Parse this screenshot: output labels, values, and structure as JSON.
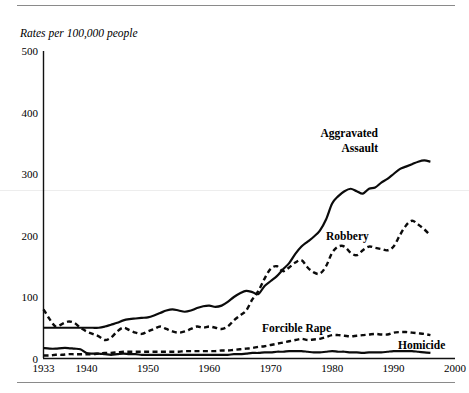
{
  "figure": {
    "axis_title": "Rates per 100,000 people",
    "x_axis_label": "",
    "y_axis_label": ""
  },
  "chart_data": {
    "type": "line",
    "title": "Rates per 100,000 people",
    "xlabel": "",
    "ylabel": "Rates per 100,000 people",
    "xlim": [
      1933,
      2000
    ],
    "ylim": [
      0,
      500
    ],
    "xticks": [
      1933,
      1940,
      1950,
      1960,
      1970,
      1980,
      1990,
      2000
    ],
    "yticks": [
      0,
      100,
      200,
      300,
      400,
      500
    ],
    "grid": false,
    "legend_position": "inline-annotations",
    "annotations": [
      {
        "text": "Aggravated Assault",
        "x": 1982,
        "y": 340,
        "style": "bold",
        "lines": [
          "Aggravated",
          "Assault"
        ]
      },
      {
        "text": "Robbery",
        "x": 1975,
        "y": 200,
        "style": "bold"
      },
      {
        "text": "Forcible Rape",
        "x": 1970,
        "y": 60,
        "style": "bold"
      },
      {
        "text": "Homicide",
        "x": 1988,
        "y": 30,
        "style": "bold"
      }
    ],
    "series": [
      {
        "name": "Aggravated Assault",
        "linestyle": "solid",
        "x": [
          1933,
          1934,
          1935,
          1936,
          1937,
          1938,
          1939,
          1940,
          1941,
          1942,
          1943,
          1944,
          1945,
          1946,
          1947,
          1948,
          1949,
          1950,
          1951,
          1952,
          1953,
          1954,
          1955,
          1956,
          1957,
          1958,
          1959,
          1960,
          1961,
          1962,
          1963,
          1964,
          1965,
          1966,
          1967,
          1968,
          1969,
          1970,
          1971,
          1972,
          1973,
          1974,
          1975,
          1976,
          1977,
          1978,
          1979,
          1980,
          1981,
          1982,
          1983,
          1984,
          1985,
          1986,
          1987,
          1988,
          1989,
          1990,
          1991,
          1992,
          1993,
          1994,
          1995,
          1996
        ],
        "values": [
          50,
          50,
          50,
          50,
          50,
          50,
          50,
          50,
          50,
          50,
          52,
          55,
          58,
          62,
          64,
          65,
          66,
          67,
          70,
          74,
          78,
          80,
          78,
          76,
          78,
          82,
          85,
          86,
          84,
          86,
          92,
          100,
          106,
          110,
          108,
          105,
          118,
          126,
          134,
          145,
          155,
          170,
          182,
          190,
          198,
          208,
          226,
          252,
          264,
          272,
          276,
          272,
          268,
          276,
          278,
          286,
          292,
          300,
          308,
          312,
          316,
          320,
          322,
          320
        ],
        "note": "smoothed reading of the solid upper curve"
      },
      {
        "name": "Robbery",
        "linestyle": "dashed",
        "x": [
          1933,
          1934,
          1935,
          1936,
          1937,
          1938,
          1939,
          1940,
          1941,
          1942,
          1943,
          1944,
          1945,
          1946,
          1947,
          1948,
          1949,
          1950,
          1951,
          1952,
          1953,
          1954,
          1955,
          1956,
          1957,
          1958,
          1959,
          1960,
          1961,
          1962,
          1963,
          1964,
          1965,
          1966,
          1967,
          1968,
          1969,
          1970,
          1971,
          1972,
          1973,
          1974,
          1975,
          1976,
          1977,
          1978,
          1979,
          1980,
          1981,
          1982,
          1983,
          1984,
          1985,
          1986,
          1987,
          1988,
          1989,
          1990,
          1991,
          1992,
          1993,
          1994,
          1995,
          1996
        ],
        "values": [
          80,
          64,
          52,
          56,
          60,
          58,
          50,
          44,
          40,
          36,
          30,
          34,
          44,
          50,
          46,
          42,
          40,
          44,
          48,
          52,
          48,
          44,
          42,
          44,
          48,
          52,
          50,
          52,
          50,
          48,
          52,
          62,
          70,
          78,
          96,
          110,
          130,
          146,
          150,
          142,
          148,
          156,
          160,
          148,
          140,
          138,
          150,
          172,
          182,
          182,
          172,
          168,
          176,
          182,
          180,
          178,
          176,
          182,
          200,
          216,
          224,
          218,
          210,
          200
        ],
        "note": "smoothed reading of the upper dashed curve"
      },
      {
        "name": "Forcible Rape",
        "linestyle": "dashed",
        "x": [
          1933,
          1934,
          1935,
          1936,
          1937,
          1938,
          1939,
          1940,
          1941,
          1942,
          1943,
          1944,
          1945,
          1946,
          1947,
          1948,
          1949,
          1950,
          1951,
          1952,
          1953,
          1954,
          1955,
          1956,
          1957,
          1958,
          1959,
          1960,
          1961,
          1962,
          1963,
          1964,
          1965,
          1966,
          1967,
          1968,
          1969,
          1970,
          1971,
          1972,
          1973,
          1974,
          1975,
          1976,
          1977,
          1978,
          1979,
          1980,
          1981,
          1982,
          1983,
          1984,
          1985,
          1986,
          1987,
          1988,
          1989,
          1990,
          1991,
          1992,
          1993,
          1994,
          1995,
          1996
        ],
        "values": [
          5,
          5,
          6,
          6,
          7,
          7,
          7,
          7,
          7,
          8,
          9,
          9,
          10,
          11,
          11,
          11,
          11,
          11,
          11,
          11,
          11,
          11,
          11,
          12,
          12,
          12,
          12,
          12,
          12,
          13,
          13,
          14,
          15,
          16,
          17,
          19,
          20,
          22,
          24,
          26,
          28,
          30,
          32,
          30,
          31,
          32,
          35,
          38,
          38,
          37,
          36,
          37,
          38,
          39,
          40,
          39,
          39,
          42,
          43,
          43,
          42,
          41,
          40,
          38
        ],
        "note": "lower dashed curve"
      },
      {
        "name": "Homicide",
        "linestyle": "solid",
        "x": [
          1933,
          1934,
          1935,
          1936,
          1937,
          1938,
          1939,
          1940,
          1941,
          1942,
          1943,
          1944,
          1945,
          1946,
          1947,
          1948,
          1949,
          1950,
          1951,
          1952,
          1953,
          1954,
          1955,
          1956,
          1957,
          1958,
          1959,
          1960,
          1961,
          1962,
          1963,
          1964,
          1965,
          1966,
          1967,
          1968,
          1969,
          1970,
          1971,
          1972,
          1973,
          1974,
          1975,
          1976,
          1977,
          1978,
          1979,
          1980,
          1981,
          1982,
          1983,
          1984,
          1985,
          1986,
          1987,
          1988,
          1989,
          1990,
          1991,
          1992,
          1993,
          1994,
          1995,
          1996
        ],
        "values": [
          17,
          16,
          16,
          17,
          17,
          16,
          15,
          9,
          8,
          8,
          7,
          6,
          7,
          8,
          7,
          7,
          6,
          6,
          6,
          6,
          6,
          6,
          6,
          6,
          6,
          6,
          6,
          6,
          6,
          6,
          6,
          7,
          7,
          8,
          9,
          9,
          10,
          10,
          11,
          11,
          12,
          12,
          12,
          11,
          10,
          10,
          11,
          12,
          11,
          11,
          10,
          10,
          9,
          10,
          10,
          10,
          11,
          12,
          12,
          12,
          12,
          11,
          10,
          9
        ],
        "note": "lowest solid curve"
      }
    ]
  },
  "ticks": {
    "x": [
      "1933",
      "1940",
      "1950",
      "1960",
      "1970",
      "1980",
      "1990",
      "2000"
    ],
    "y": [
      "0",
      "100",
      "200",
      "300",
      "400",
      "500"
    ]
  },
  "labels": {
    "aggravated_assault_line1": "Aggravated",
    "aggravated_assault_line2": "Assault",
    "robbery": "Robbery",
    "forcible_rape": "Forcible Rape",
    "homicide": "Homicide"
  }
}
